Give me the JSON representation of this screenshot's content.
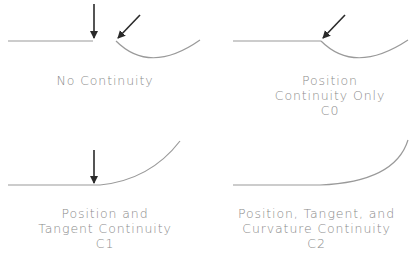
{
  "panels": [
    {
      "id": "no-continuity",
      "lines": [
        "No Continuity"
      ],
      "code": ""
    },
    {
      "id": "c0",
      "lines": [
        "Position",
        "Continuity  Only"
      ],
      "code": "C0"
    },
    {
      "id": "c1",
      "lines": [
        "Position  and",
        "Tangent  Continuity"
      ],
      "code": "C1"
    },
    {
      "id": "c2",
      "lines": [
        "Position,  Tangent,  and",
        "Curvature  Continuity"
      ],
      "code": "C2"
    }
  ],
  "colors": {
    "curve": "#9a9a9a",
    "arrow": "#2a2a2a",
    "text": "#8a8a8a"
  }
}
